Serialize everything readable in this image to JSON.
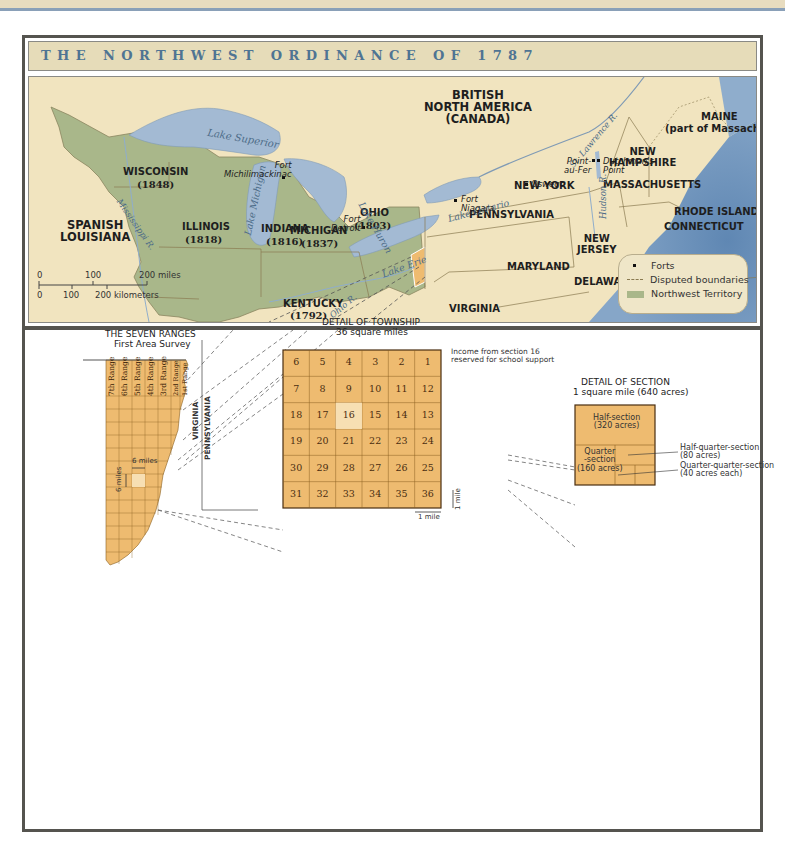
{
  "title": "THE NORTHWEST ORDINANCE OF 1787",
  "colors": {
    "land": "#f1e4bf",
    "northwest_territory": "#a9b78a",
    "water": "#a3bad3",
    "ocean": "#6f95bd",
    "seven_ranges": "#eebb70",
    "title_text": "#4f7493",
    "frame": "#55544f"
  },
  "map": {
    "regions": {
      "british_north_america": "BRITISH\nNORTH AMERICA\n(CANADA)",
      "spanish_louisiana": "SPANISH\nLOUISIANA",
      "wisconsin": "WISCONSIN",
      "wisconsin_year": "(1848)",
      "michigan": "MICHIGAN",
      "michigan_year": "(1837)",
      "illinois": "ILLINOIS",
      "illinois_year": "(1818)",
      "indiana": "INDIANA",
      "indiana_year": "(1816)",
      "ohio": "OHIO",
      "ohio_year": "(1803)",
      "kentucky": "KENTUCKY",
      "kentucky_year": "(1792)",
      "tennessee": "TENNESSEE (1796)",
      "virginia": "VIRGINIA",
      "north_carolina": "NORTH CAROLINA",
      "pennsylvania": "PENNSYLVANIA",
      "maryland": "MARYLAND",
      "delaware": "DELAWARE",
      "new_jersey": "NEW\nJERSEY",
      "new_york": "NEW YORK",
      "massachusetts": "MASSACHUSETTS",
      "rhode_island": "RHODE ISLAND",
      "connecticut": "CONNECTICUT",
      "new_hampshire": "NEW\nHAMPSHIRE",
      "maine": "MAINE",
      "maine_note": "(part of Massachusetts)"
    },
    "water": {
      "lake_superior": "Lake Superior",
      "lake_michigan": "Lake Michigan",
      "lake_huron": "Lake Huron",
      "lake_erie": "Lake Erie",
      "lake_ontario": "Lake Ontario",
      "mississippi": "Mississippi R.",
      "ohio_river": "Ohio R.",
      "st_lawrence": "St. Lawrence R.",
      "hudson": "Hudson R.",
      "atlantic": "Atlantic\nOcean"
    },
    "forts": {
      "michilimackinac": "Fort\nMichilimackinac",
      "detroit": "Fort\nDetroit",
      "niagara": "Fort\nNiagara",
      "oswego": "Oswego",
      "point_au_fer": "Point-\nau-Fer",
      "dutchmans_point": "Dutchman's\nPoint"
    },
    "scale": {
      "miles_ticks": [
        "0",
        "100",
        "200 miles"
      ],
      "km_ticks": [
        "0",
        "100",
        "200 kilometers"
      ]
    },
    "legend": {
      "forts": "Forts",
      "disputed": "Disputed boundaries",
      "territory": "Northwest Territory"
    }
  },
  "seven_ranges": {
    "title": "THE SEVEN RANGES",
    "subtitle": "First Area Survey",
    "ranges": [
      "7th Range",
      "6th Range",
      "5th Range",
      "4th Range",
      "3rd Range",
      "2nd Range",
      "1st Range"
    ],
    "virginia": "VIRGINIA",
    "pennsylvania": "PENNSYLVANIA",
    "six_miles_h": "6 miles",
    "six_miles_v": "6 miles"
  },
  "township": {
    "title": "DETAIL OF TOWNSHIP",
    "subtitle": "36 square miles",
    "rows": [
      [
        "6",
        "5",
        "4",
        "3",
        "2",
        "1"
      ],
      [
        "7",
        "8",
        "9",
        "10",
        "11",
        "12"
      ],
      [
        "18",
        "17",
        "16",
        "15",
        "14",
        "13"
      ],
      [
        "19",
        "20",
        "21",
        "22",
        "23",
        "24"
      ],
      [
        "30",
        "29",
        "28",
        "27",
        "26",
        "25"
      ],
      [
        "31",
        "32",
        "33",
        "34",
        "35",
        "36"
      ]
    ],
    "highlighted": "16",
    "note": "Income from section 16\nreserved for school support",
    "one_mile_h": "1 mile",
    "one_mile_v": "1 mile"
  },
  "section": {
    "title": "DETAIL OF SECTION",
    "subtitle": "1 square mile (640 acres)",
    "half": "Half-section\n(320 acres)",
    "quarter": "Quarter\n-section\n(160 acres)",
    "half_quarter": "Half-quarter-section\n(80 acres)",
    "quarter_quarter": "Quarter-quarter-section\n(40 acres each)"
  }
}
